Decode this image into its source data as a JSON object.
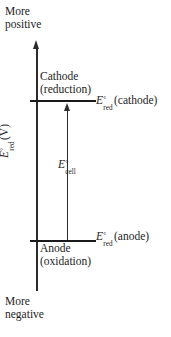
{
  "figure": {
    "type": "electrochemical-cell-potential-diagram",
    "background_color": "#ffffff",
    "line_color": "#1a1a1a",
    "text_color": "#1d1d1d"
  },
  "axis": {
    "title_parts": {
      "symbol": "E",
      "degree": "°",
      "subscript": "red",
      "unit": "(V)"
    },
    "top_label": {
      "line1": "More",
      "line2": "positive"
    },
    "bottom_label": {
      "line1": "More",
      "line2": "negative"
    },
    "direction": "up = more positive"
  },
  "levels": [
    {
      "id": "cathode",
      "label": {
        "line1": "Cathode",
        "line2": "(reduction)"
      },
      "value_symbol": {
        "symbol": "E",
        "degree": "°",
        "subscript": "red",
        "argument": "(cathode)"
      },
      "position": "upper"
    },
    {
      "id": "anode",
      "label": {
        "line1": "Anode",
        "line2": "(oxidation)"
      },
      "value_symbol": {
        "symbol": "E",
        "degree": "°",
        "subscript": "red",
        "argument": "(anode)"
      },
      "position": "lower"
    }
  ],
  "cell_potential": {
    "symbol": "E",
    "degree": "°",
    "subscript": "cell",
    "description": "arrow spanning from anode level up to cathode level"
  },
  "chart_data": {
    "type": "line",
    "title": "",
    "xlabel": "",
    "ylabel": "E°red (V)",
    "categories": [
      "Anode (oxidation)",
      "Cathode (reduction)"
    ],
    "series": [
      {
        "name": "E°red",
        "values": [
          0.0,
          1.0
        ]
      }
    ],
    "annotations": [
      {
        "text": "E°cell",
        "between": [
          "Anode (oxidation)",
          "Cathode (reduction)"
        ]
      },
      {
        "text": "More positive",
        "at": "axis-top"
      },
      {
        "text": "More negative",
        "at": "axis-bottom"
      }
    ],
    "grid": false,
    "legend": "none",
    "ylim": [
      -0.25,
      1.35
    ]
  }
}
